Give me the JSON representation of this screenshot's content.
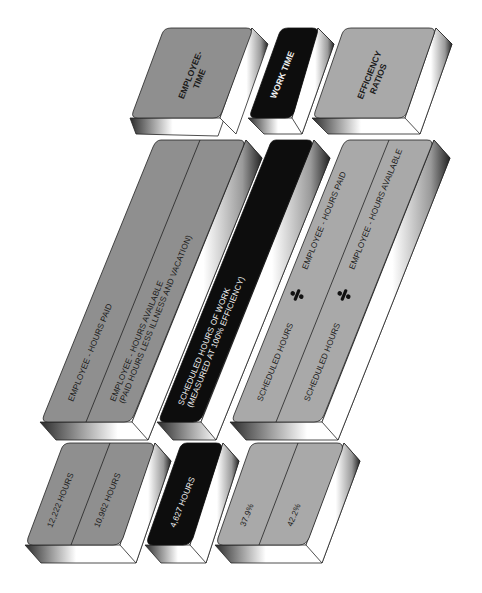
{
  "colors": {
    "employee_face": "#8f8f8f",
    "work_face": "#0d0d0d",
    "efficiency_face": "#a9a9a9",
    "extrusion": "#ffffff",
    "outline": "#2a2a2a"
  },
  "headers": {
    "employee_time": [
      "EMPLOYEE-",
      "TIME"
    ],
    "work_time": "WORK TIME",
    "efficiency_ratios": [
      "EFFICIENCY",
      "RATIOS"
    ]
  },
  "definitions": {
    "employee_hours_paid": "EMPLOYEE - HOURS PAID",
    "employee_hours_available": [
      "EMPLOYEE - HOURS AVAILABLE",
      "(PAID HOURS LESS ILLNESS AND VACATION)"
    ],
    "scheduled_hours": [
      "SCHEDULED HOURS OF WORK",
      "(MEASURED AT 100% EFFICIENCY)"
    ],
    "ratio_paid": {
      "numerator": "SCHEDULED HOURS",
      "operator": "÷",
      "denominator": "EMPLOYEE - HOURS PAID"
    },
    "ratio_available": {
      "numerator": "SCHEDULED HOURS",
      "operator": "÷",
      "denominator": "EMPLOYEE - HOURS AVAILABLE"
    }
  },
  "values": {
    "hours_paid": "12,222 HOURS",
    "hours_available": "10,962 HOURS",
    "scheduled_hours": "4,627 HOURS",
    "ratio_paid": "37.9%",
    "ratio_available": "42.2%"
  }
}
